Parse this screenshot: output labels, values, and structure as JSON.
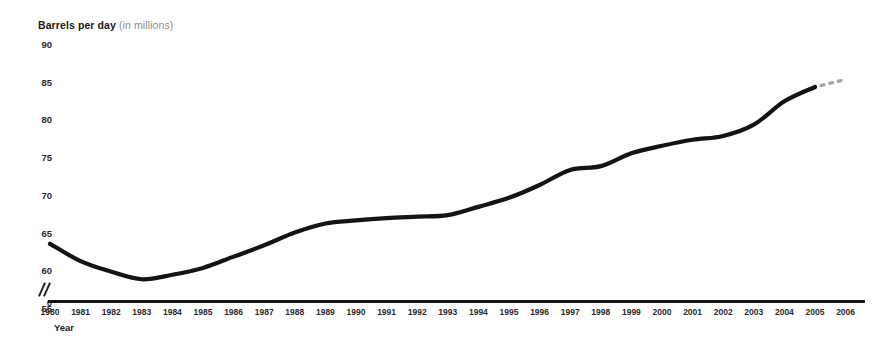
{
  "chart_data": {
    "type": "line",
    "title": "Barrels per day (in millions)",
    "title_main": "Barrels per day",
    "title_unit": "(in millions)",
    "xlabel": "Year",
    "ylabel": "Barrels per day (in millions)",
    "ylim": [
      55,
      90
    ],
    "y_ticks": [
      90,
      85,
      80,
      75,
      70,
      65,
      60,
      55
    ],
    "y_zero_label": "0",
    "axis_break": true,
    "grid": false,
    "legend": false,
    "line_color": "#141414",
    "projection_color": "#a8a8a8",
    "categories": [
      "1980",
      "1981",
      "1982",
      "1983",
      "1984",
      "1985",
      "1986",
      "1987",
      "1988",
      "1989",
      "1990",
      "1991",
      "1992",
      "1993",
      "1994",
      "1995",
      "1996",
      "1997",
      "1998",
      "1999",
      "2000",
      "2001",
      "2002",
      "2003",
      "2004",
      "2005",
      "2006"
    ],
    "series": [
      {
        "name": "World oil consumption",
        "style": "solid",
        "x": [
          "1980",
          "1981",
          "1982",
          "1983",
          "1984",
          "1985",
          "1986",
          "1987",
          "1988",
          "1989",
          "1990",
          "1991",
          "1992",
          "1993",
          "1994",
          "1995",
          "1996",
          "1997",
          "1998",
          "1999",
          "2000",
          "2001",
          "2002",
          "2003",
          "2004",
          "2005"
        ],
        "values": [
          63.5,
          61.2,
          59.8,
          58.8,
          59.4,
          60.3,
          61.8,
          63.3,
          65.0,
          66.2,
          66.6,
          66.9,
          67.1,
          67.3,
          68.4,
          69.6,
          71.3,
          73.3,
          73.8,
          75.5,
          76.5,
          77.3,
          77.8,
          79.3,
          82.4,
          84.3
        ]
      },
      {
        "name": "Projection",
        "style": "dashed",
        "x": [
          "2005",
          "2006"
        ],
        "values": [
          84.3,
          85.3
        ]
      }
    ],
    "annotations": [
      {
        "name": "projection-dashes",
        "text": "",
        "description": "three short light-gray dashes extending the line from 2005 toward 2006"
      }
    ]
  }
}
